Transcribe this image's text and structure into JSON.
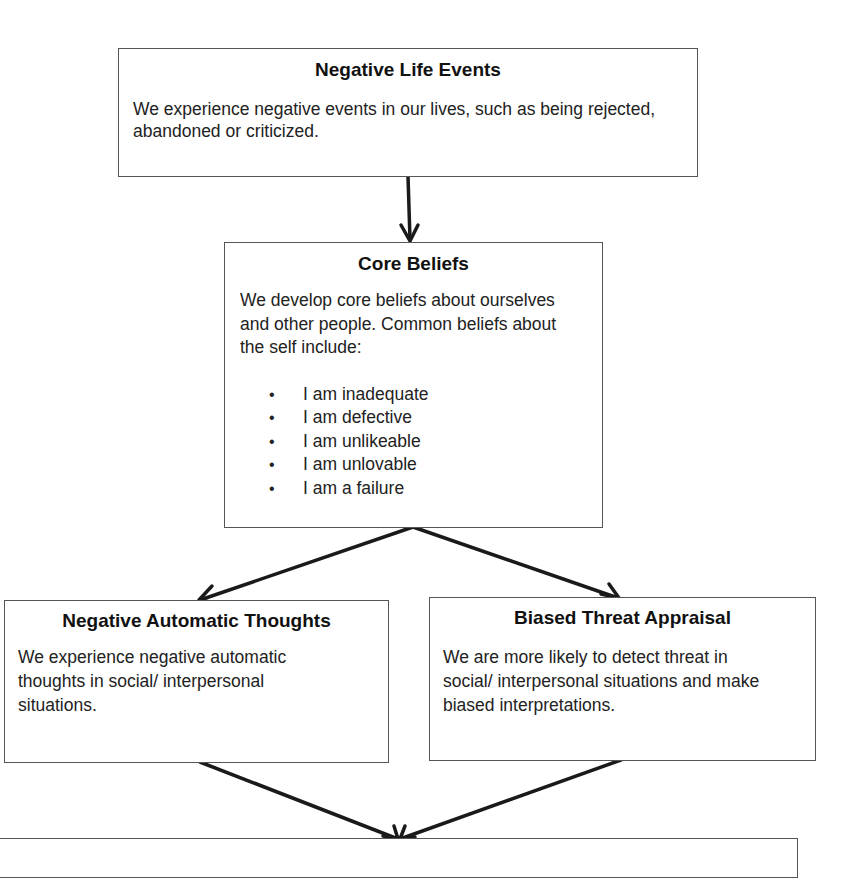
{
  "diagram": {
    "nodes": [
      {
        "id": "negative-life-events",
        "title": "Negative Life Events",
        "body": "We experience negative events in our lives, such as being rejected, abandoned or criticized."
      },
      {
        "id": "core-beliefs",
        "title": "Core Beliefs",
        "body": "We develop core beliefs about ourselves and other people.  Common beliefs about the self include:",
        "bullets": [
          "I am inadequate",
          "I am defective",
          "I am unlikeable",
          "I am unlovable",
          "I am a failure"
        ]
      },
      {
        "id": "negative-automatic-thoughts",
        "title": "Negative Automatic Thoughts",
        "body": "We experience negative automatic thoughts in social/ interpersonal situations."
      },
      {
        "id": "biased-threat-appraisal",
        "title": "Biased Threat Appraisal",
        "body": "We are more likely to detect threat in social/ interpersonal situations and make biased interpretations."
      },
      {
        "id": "bottom-box",
        "title": "",
        "body": ""
      }
    ],
    "edges": [
      {
        "from": "negative-life-events",
        "to": "core-beliefs"
      },
      {
        "from": "core-beliefs",
        "to": "negative-automatic-thoughts"
      },
      {
        "from": "core-beliefs",
        "to": "biased-threat-appraisal"
      },
      {
        "from": "negative-automatic-thoughts",
        "to": "bottom-box"
      },
      {
        "from": "biased-threat-appraisal",
        "to": "bottom-box"
      }
    ]
  }
}
